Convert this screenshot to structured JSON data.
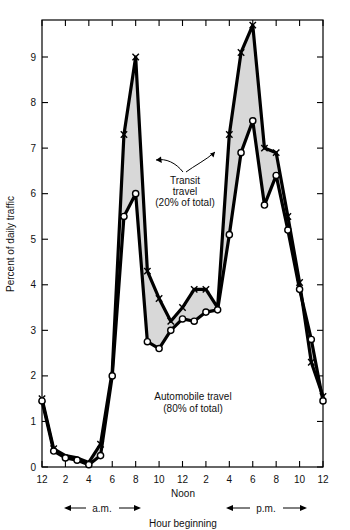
{
  "chart_data": {
    "type": "line",
    "title": "",
    "xlabel": "Hour beginning",
    "ylabel": "Percent of daily traffic",
    "xlim": [
      0,
      24
    ],
    "ylim": [
      0,
      9.9
    ],
    "grid": false,
    "legend_position": "inline-annotations",
    "x": [
      0,
      1,
      2,
      3,
      4,
      5,
      6,
      7,
      8,
      9,
      10,
      11,
      12,
      13,
      14,
      15,
      16,
      17,
      18,
      19,
      20,
      21,
      22,
      23,
      24
    ],
    "x_tick_positions": [
      0,
      2,
      4,
      6,
      8,
      10,
      12,
      14,
      16,
      18,
      20,
      22,
      24
    ],
    "x_tick_labels": [
      "12",
      "2",
      "4",
      "6",
      "8",
      "10",
      "12",
      "2",
      "4",
      "6",
      "8",
      "10",
      "12"
    ],
    "y_tick_positions": [
      0,
      1,
      2,
      3,
      4,
      5,
      6,
      7,
      8,
      9
    ],
    "y_tick_labels": [
      "0",
      "1",
      "2",
      "3",
      "4",
      "5",
      "6",
      "7",
      "8",
      "9"
    ],
    "series": [
      {
        "name": "Total travel (transit + automobile)",
        "marker": "x",
        "values": [
          1.5,
          0.4,
          0.25,
          0.2,
          0.1,
          0.5,
          2.1,
          7.3,
          9.0,
          4.3,
          3.7,
          3.2,
          3.5,
          3.9,
          3.9,
          3.5,
          7.3,
          9.1,
          9.7,
          7.0,
          6.9,
          5.5,
          4.05,
          2.3,
          1.55
        ]
      },
      {
        "name": "Automobile travel (80% of total)",
        "marker": "o",
        "values": [
          1.45,
          0.35,
          0.2,
          0.15,
          0.05,
          0.25,
          2.0,
          5.5,
          6.0,
          2.75,
          2.6,
          3.0,
          3.25,
          3.2,
          3.4,
          3.45,
          5.1,
          6.9,
          7.6,
          5.75,
          6.4,
          5.2,
          3.9,
          2.8,
          1.45
        ]
      }
    ],
    "annotations": [
      {
        "name": "transit-travel-label",
        "lines": [
          "Transit",
          "travel",
          "(20% of total)"
        ]
      },
      {
        "name": "automobile-travel-label",
        "lines": [
          "Automobile travel",
          "(80% of total)"
        ]
      },
      {
        "name": "am-span-label",
        "text": "a.m."
      },
      {
        "name": "pm-span-label",
        "text": "p.m."
      },
      {
        "name": "noon-label",
        "text": "Noon"
      }
    ],
    "colors": {
      "line": "#000000",
      "band_fill": "#d9d9d9",
      "marker_face": "#ffffff",
      "axis": "#000000",
      "background": "#ffffff"
    }
  },
  "axis": {
    "y_title": "Percent of daily traffic",
    "x_title": "Hour beginning",
    "noon": "Noon",
    "am": "a.m.",
    "pm": "p.m."
  },
  "labels": {
    "transit_1": "Transit",
    "transit_2": "travel",
    "transit_3": "(20% of total)",
    "auto_1": "Automobile travel",
    "auto_2": "(80% of total)"
  },
  "ticks": {
    "y": [
      "0",
      "1",
      "2",
      "3",
      "4",
      "5",
      "6",
      "7",
      "8",
      "9"
    ],
    "x": [
      "12",
      "2",
      "4",
      "6",
      "8",
      "10",
      "12",
      "2",
      "4",
      "6",
      "8",
      "10",
      "12"
    ]
  }
}
